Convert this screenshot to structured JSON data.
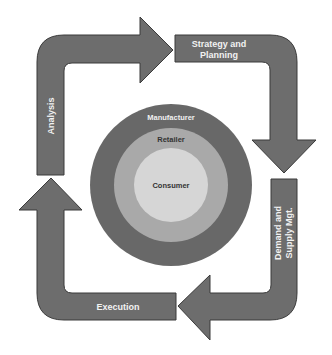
{
  "diagram": {
    "type": "cycle",
    "colors": {
      "background": "#ffffff",
      "arrow_fill": "#6d6d6d",
      "arrow_stroke": "#3a3a3a",
      "arrow_text": "#f2f2f2",
      "ring_outer": "#686868",
      "ring_middle": "#a9a9a9",
      "ring_inner": "#d6d6d6"
    },
    "cycle_steps": [
      {
        "label": "Analysis",
        "orientation": "vertical",
        "position": "left"
      },
      {
        "label_line1": "Strategy and",
        "label_line2": "Planning",
        "position": "top-right"
      },
      {
        "label_line1": "Demand and",
        "label_line2": "Supply Mgt.",
        "orientation": "vertical",
        "position": "right"
      },
      {
        "label": "Execution",
        "position": "bottom"
      }
    ],
    "rings": [
      {
        "label": "Manufacturer",
        "level": "outer"
      },
      {
        "label": "Retailer",
        "level": "middle"
      },
      {
        "label": "Consumer",
        "level": "inner"
      }
    ]
  }
}
